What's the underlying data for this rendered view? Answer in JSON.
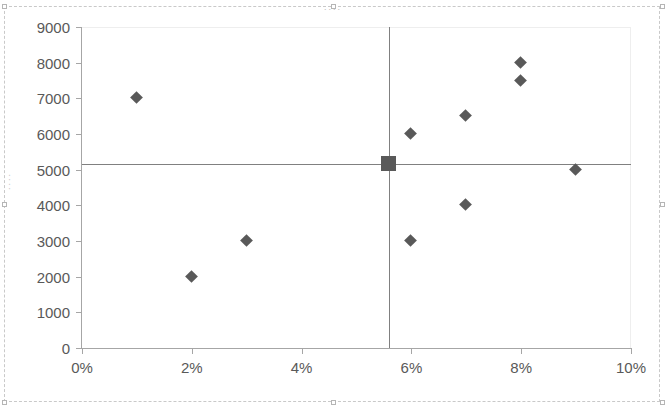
{
  "chart_data": {
    "type": "scatter",
    "title": "....",
    "subtitle": "",
    "xlabel": "",
    "ylabel": "....",
    "xlim": [
      0,
      10
    ],
    "ylim": [
      0,
      9000
    ],
    "x_tick_labels": [
      "0%",
      "2%",
      "4%",
      "6%",
      "8%",
      "10%"
    ],
    "x_tick_values": [
      0,
      2,
      4,
      6,
      8,
      10
    ],
    "y_tick_labels": [
      "0",
      "1000",
      "2000",
      "3000",
      "4000",
      "5000",
      "6000",
      "7000",
      "8000",
      "9000"
    ],
    "y_tick_values": [
      0,
      1000,
      2000,
      3000,
      4000,
      5000,
      6000,
      7000,
      8000,
      9000
    ],
    "grid": false,
    "legend": "none",
    "marker_color": "#595959",
    "axis_color": "#a6a6a6",
    "reference_line_color": "#808080",
    "series": [
      {
        "name": "Data points",
        "marker": "diamond",
        "points": [
          {
            "x": 1,
            "y": 7000
          },
          {
            "x": 2,
            "y": 2000
          },
          {
            "x": 3,
            "y": 3000
          },
          {
            "x": 6,
            "y": 6000
          },
          {
            "x": 6,
            "y": 3000
          },
          {
            "x": 7,
            "y": 6500
          },
          {
            "x": 7,
            "y": 4000
          },
          {
            "x": 8,
            "y": 8000
          },
          {
            "x": 8,
            "y": 7500
          },
          {
            "x": 9,
            "y": 5000
          }
        ]
      },
      {
        "name": "Average",
        "marker": "square",
        "points": [
          {
            "x": 5.6,
            "y": 5150
          }
        ]
      }
    ],
    "reference_lines": [
      {
        "orientation": "horizontal",
        "value": 5150
      },
      {
        "orientation": "vertical",
        "value": 5.6
      }
    ]
  }
}
